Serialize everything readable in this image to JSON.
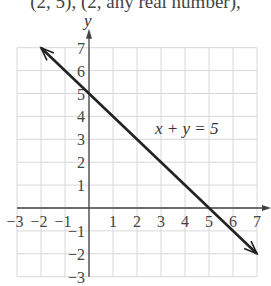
{
  "header_text": "(2, 5), (2, any real number),",
  "graph": {
    "x_axis_label": "",
    "y_axis_label": "y",
    "x_ticks": [
      "−3",
      "−2",
      "−1",
      "1",
      "2",
      "3",
      "4",
      "5",
      "6",
      "7"
    ],
    "y_ticks": [
      "7",
      "6",
      "5",
      "4",
      "3",
      "2",
      "1",
      "−1",
      "−2",
      "−3"
    ],
    "equation": "x + y = 5",
    "line_color": "#222222",
    "grid_color": "#d8d8d8"
  },
  "chart_data": {
    "type": "line",
    "title": "x + y = 5",
    "xlabel": "",
    "ylabel": "y",
    "xlim": [
      -3,
      7
    ],
    "ylim": [
      -3,
      7
    ],
    "grid": true,
    "series": [
      {
        "name": "x + y = 5",
        "x": [
          -2,
          0,
          5,
          7
        ],
        "y": [
          7,
          5,
          0,
          -2
        ]
      }
    ],
    "annotations": [
      "x + y = 5"
    ],
    "intercepts": {
      "x": 5,
      "y": 5
    },
    "arrows_at_ends": true
  }
}
